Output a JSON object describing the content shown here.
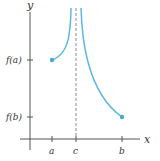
{
  "diagram": {
    "axes": {
      "x_label": "x",
      "y_label": "y"
    },
    "x_ticks": [
      {
        "label": "a",
        "x": 52
      },
      {
        "label": "c",
        "x": 76
      },
      {
        "label": "b",
        "x": 122
      }
    ],
    "y_ticks": [
      {
        "label": "f(a)",
        "y": 60
      },
      {
        "label": "f(b)",
        "y": 117
      }
    ],
    "asymptote": {
      "label": "c",
      "style": "dashed"
    },
    "colors": {
      "curve": "#5bb8e0",
      "axis": "#555555",
      "asymptote": "#999999"
    },
    "curve_points": {
      "left_endpoint": "(a, f(a))",
      "right_endpoint": "(b, f(b))"
    }
  }
}
